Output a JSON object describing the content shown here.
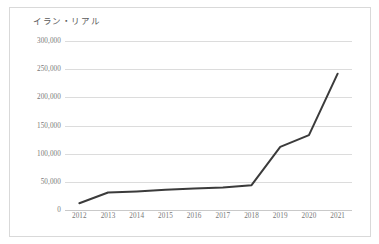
{
  "chart_data": {
    "type": "line",
    "title": "イラン・リアル",
    "xlabel": "",
    "ylabel": "",
    "categories": [
      "2012",
      "2013",
      "2014",
      "2015",
      "2016",
      "2017",
      "2018",
      "2019",
      "2020",
      "2021"
    ],
    "x": [
      2012,
      2013,
      2014,
      2015,
      2016,
      2017,
      2018,
      2019,
      2020,
      2021
    ],
    "values": [
      12000,
      31000,
      33000,
      36000,
      38000,
      40000,
      44000,
      112000,
      133000,
      242000
    ],
    "series": [
      {
        "name": "イラン・リアル",
        "values": [
          12000,
          31000,
          33000,
          36000,
          38000,
          40000,
          44000,
          112000,
          133000,
          242000
        ]
      }
    ],
    "ylim": [
      0,
      300000
    ],
    "yticks": [
      0,
      50000,
      100000,
      150000,
      200000,
      250000,
      300000
    ],
    "ytick_labels": [
      "0",
      "50,000",
      "100,000",
      "150,000",
      "200,000",
      "250,000",
      "300,000"
    ],
    "xtick_labels": [
      "2012",
      "2013",
      "2014",
      "2015",
      "2016",
      "2017",
      "2018",
      "2019",
      "2020",
      "2021"
    ],
    "grid": "horizontal",
    "legend": "none",
    "colors": {
      "line": "#3b3b3b",
      "gridline": "#dcdcdc",
      "axis_text": "#787878",
      "title_text": "#5a5a5a",
      "border": "#d9d9d9",
      "background": "#ffffff"
    }
  }
}
